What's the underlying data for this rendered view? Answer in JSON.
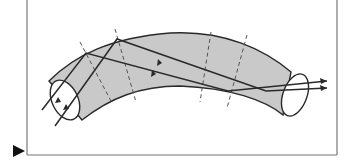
{
  "figure": {
    "colors": {
      "fiber_fill": "#c9c9c9",
      "line": "#2a2a2a",
      "dash": "#555555",
      "frame": "#777777",
      "marker": "#111111"
    },
    "elements": {
      "fiber": "curved-optical-fiber",
      "entry_face": "entry-ellipse",
      "exit_face": "exit-ellipse",
      "rays": [
        "ray-1",
        "ray-2"
      ],
      "normals_count": 4,
      "marker": "triangle-pointer"
    }
  }
}
